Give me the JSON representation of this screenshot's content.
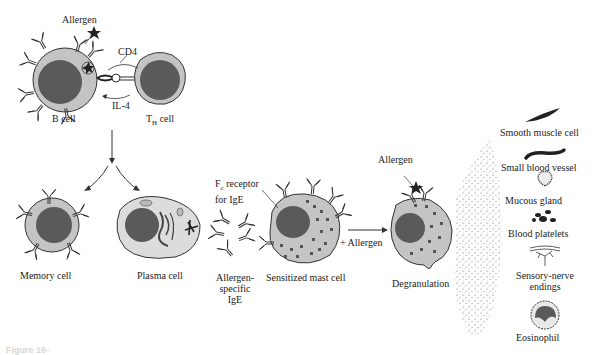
{
  "figure": {
    "caption_fragment": "Figure 16-",
    "stages": {
      "b_cell_activation": {
        "allergen_label": "Allergen",
        "cd4_label": "CD4",
        "il4_label": "IL-4",
        "b_cell_label": "B cell",
        "th_cell_label_main": "T",
        "th_cell_label_sub": "H",
        "th_cell_label_suffix": " cell"
      },
      "differentiation": {
        "memory_cell_label": "Memory cell",
        "plasma_cell_label": "Plasma cell"
      },
      "ige": {
        "line1": "Allergen-",
        "line2": "specific",
        "line3": "IgE"
      },
      "sensitization": {
        "fc_receptor_line1_main": "F",
        "fc_receptor_line1_sub": "c",
        "fc_receptor_line1_rest": " receptor",
        "fc_receptor_line2": "for IgE",
        "mast_cell_label": "Sensitized mast cell",
        "plus_allergen_label": "+ Allergen"
      },
      "degranulation": {
        "allergen_label": "Allergen",
        "degranulation_label": "Degranulation"
      }
    },
    "targets": [
      {
        "id": "smooth-muscle-cell",
        "label": "Smooth muscle cell"
      },
      {
        "id": "small-blood-vessel",
        "label": "Small blood vessel"
      },
      {
        "id": "mucous-gland",
        "label": "Mucous gland"
      },
      {
        "id": "blood-platelets",
        "label": "Blood platelets"
      },
      {
        "id": "sensory-nerve-endings",
        "label_line1": "Sensory-nerve",
        "label_line2": "endings"
      },
      {
        "id": "eosinophil",
        "label": "Eosinophil"
      }
    ],
    "colors": {
      "cytoplasm": "#c4c4c4",
      "nucleus": "#5a5a5a",
      "outline": "#333333",
      "granule": "#555555",
      "mediator_dots": "#666666"
    }
  }
}
